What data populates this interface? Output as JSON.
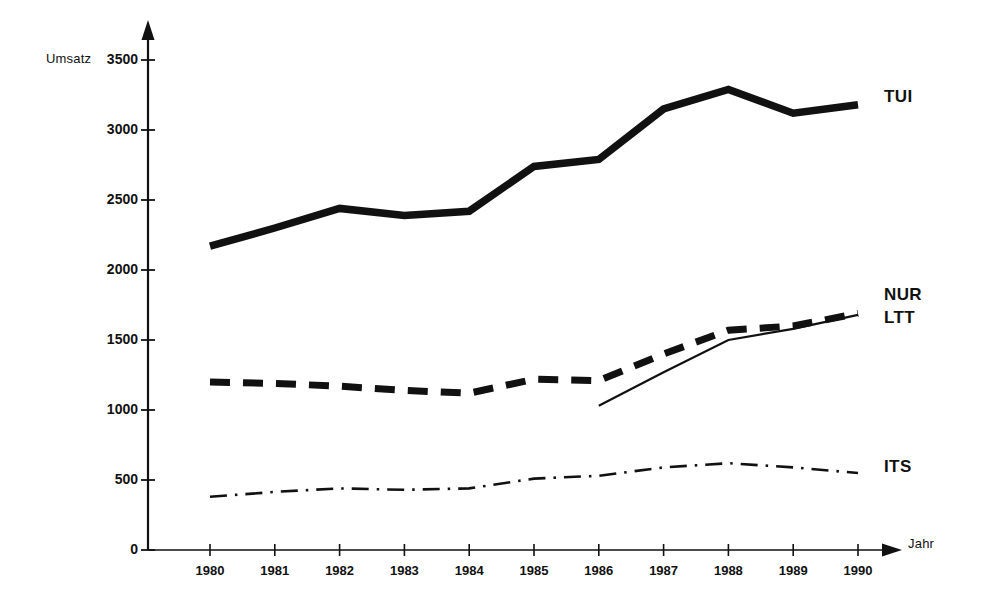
{
  "chart_data": {
    "type": "line",
    "title": "",
    "xlabel": "Jahr",
    "ylabel": "Umsatz",
    "x": [
      1980,
      1981,
      1982,
      1983,
      1984,
      1985,
      1986,
      1987,
      1988,
      1989,
      1990
    ],
    "categories": [
      "1980",
      "1981",
      "1982",
      "1983",
      "1984",
      "1985",
      "1986",
      "1987",
      "1988",
      "1989",
      "1990"
    ],
    "xlim": [
      1980,
      1990
    ],
    "ylim": [
      0,
      3500
    ],
    "yticks": [
      0,
      500,
      1000,
      1500,
      2000,
      2500,
      3000,
      3500
    ],
    "ytick_labels": [
      "0",
      "500",
      "1000",
      "1500",
      "2000",
      "2500",
      "3000",
      "3500"
    ],
    "grid": false,
    "legend_position": "right-inline",
    "series": [
      {
        "name": "TUI",
        "style": "thick-solid",
        "x": [
          1980,
          1981,
          1982,
          1983,
          1984,
          1985,
          1986,
          1987,
          1988,
          1989,
          1990
        ],
        "values": [
          2170,
          2300,
          2440,
          2390,
          2420,
          2740,
          2790,
          3150,
          3290,
          3120,
          3180
        ]
      },
      {
        "name": "NUR",
        "style": "thick-dashed",
        "x": [
          1980,
          1981,
          1982,
          1983,
          1984,
          1985,
          1986,
          1987,
          1988,
          1989,
          1990
        ],
        "values": [
          1200,
          1190,
          1170,
          1140,
          1120,
          1220,
          1210,
          1400,
          1570,
          1600,
          1690
        ]
      },
      {
        "name": "LTT",
        "style": "thin-solid",
        "x": [
          1986,
          1987,
          1988,
          1989,
          1990
        ],
        "values": [
          1030,
          1270,
          1500,
          1580,
          1680
        ]
      },
      {
        "name": "ITS",
        "style": "dash-dot",
        "x": [
          1980,
          1981,
          1982,
          1983,
          1984,
          1985,
          1986,
          1987,
          1988,
          1989,
          1990
        ],
        "values": [
          380,
          415,
          440,
          430,
          440,
          510,
          530,
          590,
          620,
          590,
          550
        ]
      }
    ]
  },
  "axes": {
    "y_title": "Umsatz",
    "x_title": "Jahr"
  },
  "legend": {
    "tui": "TUI",
    "nur": "NUR",
    "ltt": "LTT",
    "its": "ITS"
  },
  "colors": {
    "ink": "#111111",
    "background": "#ffffff"
  }
}
